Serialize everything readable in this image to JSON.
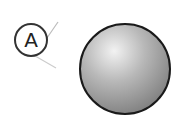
{
  "diagram": {
    "label": "A",
    "object": "sphere",
    "colors": {
      "outline": "#1a1a1a",
      "sphere_highlight": "#eeeeee",
      "sphere_shadow": "#8a8a8a",
      "leader_line": "#bbbbbb"
    }
  }
}
